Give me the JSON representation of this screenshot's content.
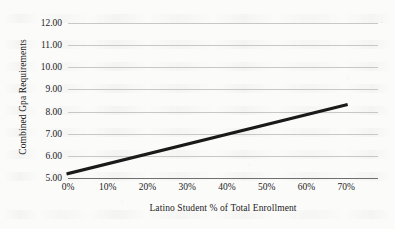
{
  "chart_data": {
    "type": "line",
    "title": "",
    "xlabel": "Latino Student % of Total Enrollment",
    "ylabel": "Combined Gpa Requirements",
    "x": [
      0,
      70
    ],
    "values": [
      5.2,
      8.3
    ],
    "series": [
      {
        "name": "Combined Gpa Requirements",
        "values": [
          5.2,
          8.3
        ],
        "color": "#1a1a1a"
      }
    ],
    "x_tick_labels": [
      "0%",
      "10%",
      "20%",
      "30%",
      "40%",
      "50%",
      "60%",
      "70%"
    ],
    "x_tick_values": [
      0,
      10,
      20,
      30,
      40,
      50,
      60,
      70
    ],
    "y_tick_labels": [
      "12.00",
      "11.00",
      "10.00",
      "9.00",
      "8.00",
      "7.00",
      "6.00",
      "5.00"
    ],
    "y_tick_values": [
      12,
      11,
      10,
      9,
      8,
      7,
      6,
      5
    ],
    "xlim": [
      0,
      78
    ],
    "ylim": [
      5,
      12
    ],
    "grid": "horizontal",
    "legend": "none",
    "line_color": "#1a1a1a",
    "gridline_color": "#c8c8c8",
    "baseline_color": "#6f6f6f",
    "background_color": "#fbfbfa"
  },
  "corner_mark": "·"
}
